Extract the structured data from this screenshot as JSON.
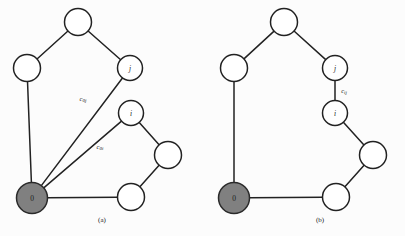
{
  "figure": {
    "background_color": "#fcfcfc",
    "stroke_color": "#222222",
    "node_fill": "#ffffff",
    "depot_fill": "#808080",
    "panels": [
      {
        "id": "panel-a",
        "caption": "(a)",
        "caption_x": 102,
        "caption_y": 220,
        "nodes": [
          {
            "id": "a-top",
            "label": "",
            "x": 78,
            "y": 22,
            "r": 13.5,
            "type": "plain"
          },
          {
            "id": "a-left",
            "label": "",
            "x": 27,
            "y": 68,
            "r": 13.5,
            "type": "plain"
          },
          {
            "id": "a-j",
            "label": "j",
            "x": 130,
            "y": 68,
            "r": 12.5,
            "type": "plain"
          },
          {
            "id": "a-i",
            "label": "i",
            "x": 131,
            "y": 113,
            "r": 12.5,
            "type": "plain"
          },
          {
            "id": "a-right",
            "label": "",
            "x": 168,
            "y": 155,
            "r": 13.5,
            "type": "plain"
          },
          {
            "id": "a-bottom",
            "label": "",
            "x": 131,
            "y": 197,
            "r": 13.5,
            "type": "plain"
          },
          {
            "id": "a-depot",
            "label": "0",
            "x": 32,
            "y": 198,
            "r": 15.5,
            "type": "depot"
          }
        ],
        "edges": [
          {
            "from": "a-left",
            "to": "a-top"
          },
          {
            "from": "a-top",
            "to": "a-j"
          },
          {
            "from": "a-left",
            "to": "a-depot"
          },
          {
            "from": "a-depot",
            "to": "a-j"
          },
          {
            "from": "a-depot",
            "to": "a-i"
          },
          {
            "from": "a-i",
            "to": "a-right"
          },
          {
            "from": "a-right",
            "to": "a-bottom"
          },
          {
            "from": "a-depot",
            "to": "a-bottom"
          }
        ],
        "cost_labels": [
          {
            "id": "a-cost-0j",
            "text": "c0j",
            "x": 83,
            "y": 98,
            "rotate": 0
          },
          {
            "id": "a-cost-0i",
            "text": "c0i",
            "x": 100,
            "y": 146,
            "rotate": 0
          }
        ]
      },
      {
        "id": "panel-b",
        "caption": "(b)",
        "caption_x": 320,
        "caption_y": 220,
        "nodes": [
          {
            "id": "b-top",
            "label": "",
            "x": 284,
            "y": 22,
            "r": 13.5,
            "type": "plain"
          },
          {
            "id": "b-left",
            "label": "",
            "x": 234,
            "y": 68,
            "r": 13.5,
            "type": "plain"
          },
          {
            "id": "b-j",
            "label": "j",
            "x": 335,
            "y": 68,
            "r": 12.5,
            "type": "plain"
          },
          {
            "id": "b-i",
            "label": "i",
            "x": 335,
            "y": 113,
            "r": 12.5,
            "type": "plain"
          },
          {
            "id": "b-right",
            "label": "",
            "x": 373,
            "y": 155,
            "r": 13.5,
            "type": "plain"
          },
          {
            "id": "b-bottom",
            "label": "",
            "x": 336,
            "y": 197,
            "r": 13.5,
            "type": "plain"
          },
          {
            "id": "b-depot",
            "label": "0",
            "x": 234,
            "y": 198,
            "r": 15.5,
            "type": "depot"
          }
        ],
        "edges": [
          {
            "from": "b-left",
            "to": "b-top"
          },
          {
            "from": "b-top",
            "to": "b-j"
          },
          {
            "from": "b-j",
            "to": "b-i"
          },
          {
            "from": "b-left",
            "to": "b-depot"
          },
          {
            "from": "b-i",
            "to": "b-right"
          },
          {
            "from": "b-right",
            "to": "b-bottom"
          },
          {
            "from": "b-depot",
            "to": "b-bottom"
          }
        ],
        "cost_labels": [
          {
            "id": "b-cost-ij",
            "text": "cij",
            "x": 344,
            "y": 90,
            "rotate": 0
          }
        ]
      }
    ]
  }
}
